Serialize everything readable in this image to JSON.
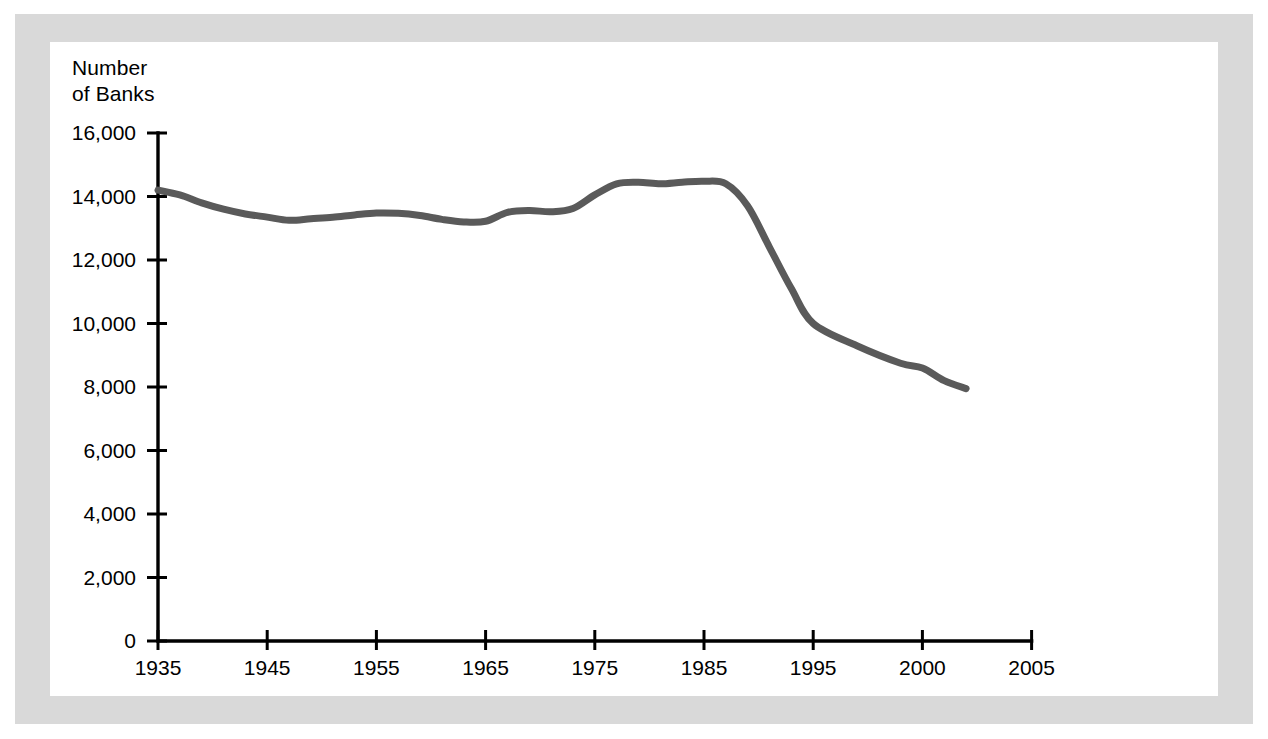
{
  "figure": {
    "background_color": "#ffffff",
    "mat_color": "#d9d9d9",
    "canvas_color": "#ffffff"
  },
  "axis_title": "Number\nof Banks",
  "chart_data": {
    "type": "line",
    "title": "",
    "subtitle": "",
    "xlabel": "",
    "ylabel": "Number of Banks",
    "ylim": [
      0,
      16000
    ],
    "xlim": [
      1935,
      2005
    ],
    "grid": false,
    "legend": null,
    "line_color": "#5a5a5a",
    "line_width": 7,
    "y_ticks": [
      0,
      2000,
      4000,
      6000,
      8000,
      10000,
      12000,
      14000,
      16000
    ],
    "y_tick_labels": [
      "0",
      "2,000",
      "4,000",
      "6,000",
      "8,000",
      "10,000",
      "12,000",
      "14,000",
      "16,000"
    ],
    "x_ticks": [
      1935,
      1945,
      1955,
      1965,
      1975,
      1985,
      1995,
      2000,
      2005
    ],
    "x_tick_labels": [
      "1935",
      "1945",
      "1955",
      "1965",
      "1975",
      "1985",
      "1995",
      "2000",
      "2005"
    ],
    "series": [
      {
        "name": "Number of Banks",
        "x": [
          1935,
          1937,
          1939,
          1941,
          1943,
          1945,
          1947,
          1949,
          1951,
          1953,
          1955,
          1957,
          1959,
          1961,
          1963,
          1965,
          1967,
          1969,
          1971,
          1973,
          1975,
          1977,
          1979,
          1981,
          1983,
          1985,
          1987,
          1989,
          1991,
          1993,
          1995,
          1997,
          1999,
          2000,
          2001,
          2002
        ],
        "values": [
          14200,
          14050,
          13800,
          13600,
          13450,
          13350,
          13250,
          13300,
          13350,
          13420,
          13480,
          13470,
          13400,
          13280,
          13200,
          13220,
          13500,
          13560,
          13520,
          13620,
          14050,
          14400,
          14450,
          14400,
          14450,
          14480,
          14400,
          13700,
          12400,
          11100,
          10000,
          9300,
          8750,
          8600,
          8200,
          7950
        ]
      }
    ],
    "annotations": []
  }
}
